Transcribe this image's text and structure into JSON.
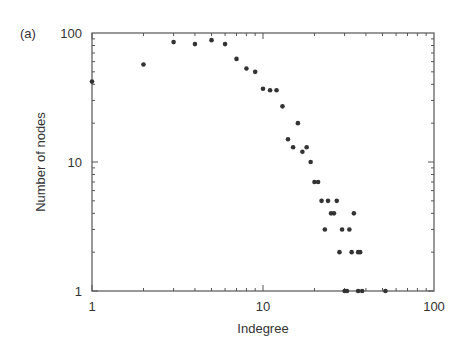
{
  "chart_data": {
    "type": "scatter",
    "panel_label": "(a)",
    "title": "",
    "xlabel": "Indegree",
    "ylabel": "Number of nodes",
    "xscale": "log",
    "yscale": "log",
    "xlim": [
      1,
      100
    ],
    "ylim": [
      1,
      100
    ],
    "x_ticks": [
      1,
      10,
      100
    ],
    "x_tick_labels": [
      "1",
      "10",
      "100"
    ],
    "y_ticks": [
      1,
      10,
      100
    ],
    "y_tick_labels": [
      "1",
      "10",
      "100"
    ],
    "grid": false,
    "legend": null,
    "marker_color": "#333333",
    "series": [
      {
        "name": "indegree distribution",
        "points": [
          [
            1,
            42
          ],
          [
            2,
            57
          ],
          [
            3,
            85
          ],
          [
            4,
            82
          ],
          [
            5,
            88
          ],
          [
            6,
            82
          ],
          [
            7,
            63
          ],
          [
            8,
            53
          ],
          [
            9,
            50
          ],
          [
            10,
            37
          ],
          [
            11,
            36
          ],
          [
            12,
            36
          ],
          [
            13,
            27
          ],
          [
            14,
            15
          ],
          [
            15,
            13
          ],
          [
            16,
            20
          ],
          [
            17,
            12
          ],
          [
            18,
            13
          ],
          [
            19,
            10
          ],
          [
            20,
            7
          ],
          [
            21,
            7
          ],
          [
            22,
            5
          ],
          [
            23,
            3
          ],
          [
            24,
            5
          ],
          [
            25,
            4
          ],
          [
            26,
            4
          ],
          [
            27,
            5
          ],
          [
            28,
            2
          ],
          [
            29,
            3
          ],
          [
            30,
            1
          ],
          [
            31,
            1
          ],
          [
            32,
            3
          ],
          [
            33,
            2
          ],
          [
            34,
            4
          ],
          [
            36,
            2
          ],
          [
            37,
            2
          ],
          [
            36,
            1
          ],
          [
            38,
            1
          ],
          [
            52,
            1
          ]
        ]
      }
    ]
  }
}
